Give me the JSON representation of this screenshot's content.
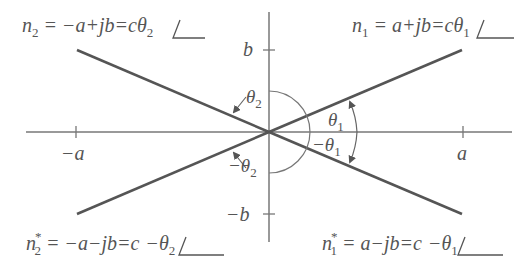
{
  "diagram": {
    "colors": {
      "axis": "#666666",
      "vector": "#555555",
      "text": "#555555",
      "background": "#ffffff"
    },
    "axes": {
      "horizontal": {
        "ticks": [
          {
            "label": "−a",
            "position": "negative"
          },
          {
            "label": "a",
            "position": "positive"
          }
        ]
      },
      "vertical": {
        "ticks": [
          {
            "label": "b",
            "position": "positive"
          },
          {
            "label": "−b",
            "position": "negative"
          }
        ]
      }
    },
    "roots": [
      {
        "id": "n1",
        "name": "n",
        "sub": "1",
        "sup": "",
        "expr": " = a+jb=c",
        "angle": "θ",
        "angle_sub": "1",
        "angle_prefix": ""
      },
      {
        "id": "n2",
        "name": "n",
        "sub": "2",
        "sup": "",
        "expr": " = −a+jb=c",
        "angle": "θ",
        "angle_sub": "2",
        "angle_prefix": ""
      },
      {
        "id": "n2star",
        "name": "n",
        "sub": "2",
        "sup": "*",
        "expr": " = −a−jb=c",
        "angle": "θ",
        "angle_sub": "2",
        "angle_prefix": "−"
      },
      {
        "id": "n1star",
        "name": "n",
        "sub": "1",
        "sup": "*",
        "expr": " = a−jb=c",
        "angle": "θ",
        "angle_sub": "1",
        "angle_prefix": "−"
      }
    ],
    "angle_labels": {
      "theta1": {
        "sym": "θ",
        "sub": "1",
        "prefix": ""
      },
      "neg_theta1": {
        "sym": "θ",
        "sub": "1",
        "prefix": "−"
      },
      "theta2": {
        "sym": "θ",
        "sub": "2",
        "prefix": ""
      },
      "neg_theta2": {
        "sym": "θ",
        "sub": "2",
        "prefix": "−"
      }
    }
  }
}
